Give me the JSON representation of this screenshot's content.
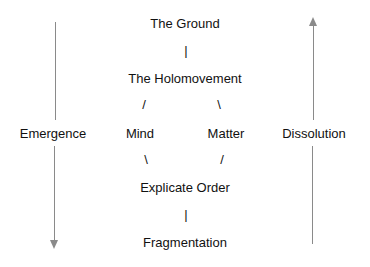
{
  "diagram": {
    "nodes": {
      "ground": "The Ground",
      "holomovement": "The Holomovement",
      "mind": "Mind",
      "matter": "Matter",
      "explicate": "Explicate Order",
      "fragmentation": "Fragmentation"
    },
    "connectors": {
      "ground_holo": "|",
      "holo_mind": "/",
      "holo_matter": "\\",
      "mind_explicate": "\\",
      "matter_explicate": "/",
      "explicate_frag": "|"
    },
    "side_labels": {
      "left": "Emergence",
      "right": "Dissolution"
    },
    "arrows": {
      "left": {
        "direction": "down",
        "color": "#8a8a8a"
      },
      "right": {
        "direction": "up",
        "color": "#8a8a8a"
      }
    }
  }
}
